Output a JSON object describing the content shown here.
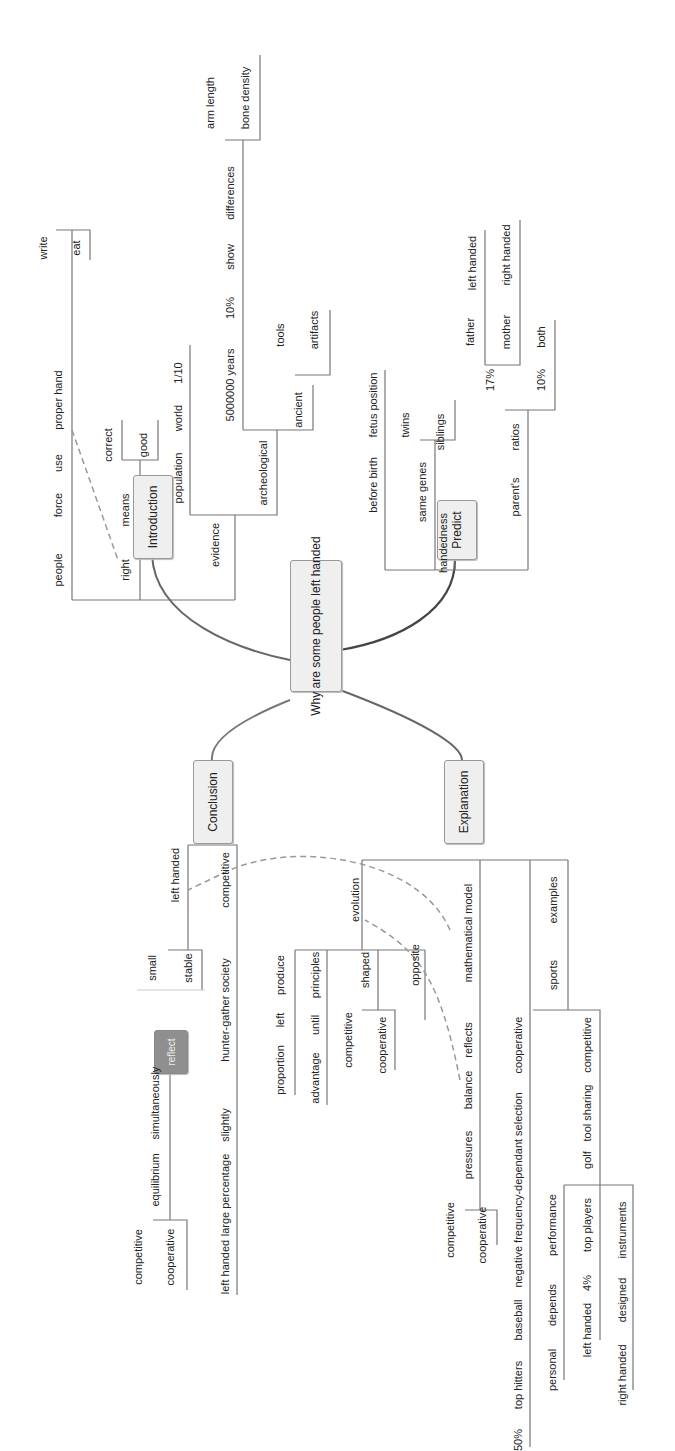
{
  "central": {
    "label": "Why are some people left handed"
  },
  "branches": {
    "introduction": {
      "label": "Introduction"
    },
    "predict": {
      "label": "Predict"
    },
    "conclusion": {
      "label": "Conclusion"
    },
    "explanation": {
      "label": "Explanation"
    }
  },
  "nodes": [
    {
      "t": "write",
      "x": 43,
      "y": 248
    },
    {
      "t": "eat",
      "x": 76,
      "y": 248
    },
    {
      "t": "people",
      "x": 58,
      "y": 570
    },
    {
      "t": "force",
      "x": 58,
      "y": 505
    },
    {
      "t": "use",
      "x": 58,
      "y": 463
    },
    {
      "t": "proper hand",
      "x": 58,
      "y": 400
    },
    {
      "t": "right",
      "x": 125,
      "y": 570
    },
    {
      "t": "means",
      "x": 125,
      "y": 510
    },
    {
      "t": "correct",
      "x": 108,
      "y": 445
    },
    {
      "t": "good",
      "x": 143,
      "y": 445
    },
    {
      "t": "evidence",
      "x": 215,
      "y": 545
    },
    {
      "t": "population",
      "x": 178,
      "y": 478
    },
    {
      "t": "world",
      "x": 178,
      "y": 418
    },
    {
      "t": "1/10",
      "x": 178,
      "y": 373
    },
    {
      "t": "archeological",
      "x": 263,
      "y": 473
    },
    {
      "t": "ancient",
      "x": 298,
      "y": 410
    },
    {
      "t": "tools",
      "x": 280,
      "y": 335
    },
    {
      "t": "artifacts",
      "x": 314,
      "y": 330
    },
    {
      "t": "5000000 years",
      "x": 230,
      "y": 385
    },
    {
      "t": "10%",
      "x": 230,
      "y": 308
    },
    {
      "t": "show",
      "x": 230,
      "y": 257
    },
    {
      "t": "differences",
      "x": 230,
      "y": 193
    },
    {
      "t": "arm length",
      "x": 210,
      "y": 103
    },
    {
      "t": "bone density",
      "x": 245,
      "y": 98
    },
    {
      "t": "before birth",
      "x": 373,
      "y": 485
    },
    {
      "t": "fetus position",
      "x": 373,
      "y": 405
    },
    {
      "t": "twins",
      "x": 405,
      "y": 425
    },
    {
      "t": "same genes",
      "x": 422,
      "y": 492
    },
    {
      "t": "siblings",
      "x": 440,
      "y": 432
    },
    {
      "t": "handedness",
      "x": 443,
      "y": 543
    },
    {
      "t": "parent's",
      "x": 515,
      "y": 497
    },
    {
      "t": "ratios",
      "x": 515,
      "y": 437
    },
    {
      "t": "17%",
      "x": 490,
      "y": 380
    },
    {
      "t": "10%",
      "x": 541,
      "y": 380
    },
    {
      "t": "both",
      "x": 541,
      "y": 337
    },
    {
      "t": "father",
      "x": 470,
      "y": 332
    },
    {
      "t": "left handed",
      "x": 472,
      "y": 263
    },
    {
      "t": "mother",
      "x": 506,
      "y": 332
    },
    {
      "t": "right handed",
      "x": 506,
      "y": 255
    },
    {
      "t": "left handed",
      "x": 175,
      "y": 875
    },
    {
      "t": "competitive",
      "x": 225,
      "y": 880
    },
    {
      "t": "small",
      "x": 152,
      "y": 968
    },
    {
      "t": "stable",
      "x": 188,
      "y": 968
    },
    {
      "t": "hunter-gather society",
      "x": 225,
      "y": 1010
    },
    {
      "t": "slightly",
      "x": 225,
      "y": 1125
    },
    {
      "t": "large percentage",
      "x": 225,
      "y": 1195
    },
    {
      "t": "left handed",
      "x": 225,
      "y": 1267
    },
    {
      "t": "simultaneously",
      "x": 155,
      "y": 1103
    },
    {
      "t": "equilibrium",
      "x": 155,
      "y": 1180
    },
    {
      "t": "competitive",
      "x": 138,
      "y": 1257
    },
    {
      "t": "cooperative",
      "x": 170,
      "y": 1257
    },
    {
      "t": "evolution",
      "x": 355,
      "y": 900
    },
    {
      "t": "produce",
      "x": 280,
      "y": 975
    },
    {
      "t": "left",
      "x": 280,
      "y": 1020
    },
    {
      "t": "proportion",
      "x": 280,
      "y": 1070
    },
    {
      "t": "principles",
      "x": 315,
      "y": 975
    },
    {
      "t": "until",
      "x": 315,
      "y": 1025
    },
    {
      "t": "advantage",
      "x": 315,
      "y": 1078
    },
    {
      "t": "shaped",
      "x": 365,
      "y": 970
    },
    {
      "t": "competitive",
      "x": 348,
      "y": 1040
    },
    {
      "t": "cooperative",
      "x": 382,
      "y": 1045
    },
    {
      "t": "opposite",
      "x": 415,
      "y": 965
    },
    {
      "t": "mathematical model",
      "x": 468,
      "y": 933
    },
    {
      "t": "reflects",
      "x": 468,
      "y": 1040
    },
    {
      "t": "balance",
      "x": 468,
      "y": 1090
    },
    {
      "t": "pressures",
      "x": 468,
      "y": 1155
    },
    {
      "t": "competitive",
      "x": 450,
      "y": 1230
    },
    {
      "t": "cooperative",
      "x": 482,
      "y": 1235
    },
    {
      "t": "examples",
      "x": 553,
      "y": 900
    },
    {
      "t": "sports",
      "x": 553,
      "y": 975
    },
    {
      "t": "cooperative",
      "x": 518,
      "y": 1045
    },
    {
      "t": "negative frequency-dependant selection",
      "x": 518,
      "y": 1190
    },
    {
      "t": "baseball",
      "x": 518,
      "y": 1320
    },
    {
      "t": "top hitters",
      "x": 518,
      "y": 1385
    },
    {
      "t": "50%",
      "x": 518,
      "y": 1440
    },
    {
      "t": "competitive",
      "x": 587,
      "y": 1045
    },
    {
      "t": "tool sharing",
      "x": 587,
      "y": 1113
    },
    {
      "t": "golf",
      "x": 587,
      "y": 1160
    },
    {
      "t": "performance",
      "x": 552,
      "y": 1225
    },
    {
      "t": "depends",
      "x": 552,
      "y": 1305
    },
    {
      "t": "personal",
      "x": 552,
      "y": 1370
    },
    {
      "t": "top players",
      "x": 587,
      "y": 1225
    },
    {
      "t": "4%",
      "x": 587,
      "y": 1283
    },
    {
      "t": "left handed",
      "x": 587,
      "y": 1330
    },
    {
      "t": "instruments",
      "x": 622,
      "y": 1230
    },
    {
      "t": "designed",
      "x": 622,
      "y": 1300
    },
    {
      "t": "right handed",
      "x": 622,
      "y": 1375
    }
  ],
  "reflect_node": {
    "label": "reflect"
  }
}
